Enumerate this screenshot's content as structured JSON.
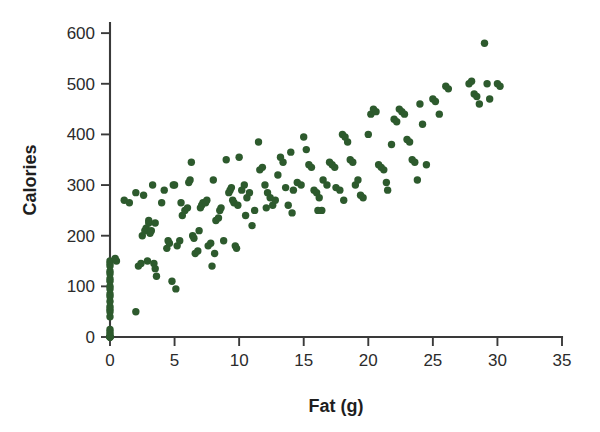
{
  "chart_data": {
    "type": "scatter",
    "title": "",
    "xlabel": "Fat (g)",
    "ylabel": "Calories",
    "xlim": [
      0,
      35
    ],
    "ylim": [
      0,
      620
    ],
    "xticks": [
      0,
      5,
      10,
      15,
      20,
      25,
      30,
      35
    ],
    "yticks": [
      0,
      100,
      200,
      300,
      400,
      500,
      600
    ],
    "xtick_labels": [
      "0",
      "5",
      "10",
      "15",
      "20",
      "25",
      "30",
      "35"
    ],
    "ytick_labels": [
      "0",
      "100",
      "200",
      "300",
      "400",
      "500",
      "600"
    ],
    "grid": false,
    "legend": false,
    "marker_color": "#2d5a2d",
    "marker_size": 5.4,
    "axis_color": "#3a3a3a",
    "background_color": "#ffffff",
    "n_points": 178,
    "series": [
      {
        "name": "Menu items",
        "color": "#2d5a2d",
        "points": [
          [
            0,
            0
          ],
          [
            0,
            0
          ],
          [
            0,
            0
          ],
          [
            0,
            0
          ],
          [
            0,
            5
          ],
          [
            0,
            10
          ],
          [
            0,
            15
          ],
          [
            0,
            40
          ],
          [
            0,
            50
          ],
          [
            0,
            55
          ],
          [
            0,
            60
          ],
          [
            0,
            70
          ],
          [
            0,
            80
          ],
          [
            0,
            85
          ],
          [
            0,
            95
          ],
          [
            0,
            100
          ],
          [
            0,
            110
          ],
          [
            0,
            115
          ],
          [
            0,
            125
          ],
          [
            0,
            130
          ],
          [
            0,
            140
          ],
          [
            0,
            145
          ],
          [
            0,
            150
          ],
          [
            0.4,
            155
          ],
          [
            0.5,
            150
          ],
          [
            2.0,
            50
          ],
          [
            1.1,
            270
          ],
          [
            1.5,
            265
          ],
          [
            2.0,
            285
          ],
          [
            2.2,
            140
          ],
          [
            2.4,
            145
          ],
          [
            2.5,
            200
          ],
          [
            2.6,
            280
          ],
          [
            2.7,
            210
          ],
          [
            2.8,
            215
          ],
          [
            2.9,
            150
          ],
          [
            3.0,
            225
          ],
          [
            3.0,
            230
          ],
          [
            3.1,
            205
          ],
          [
            3.2,
            210
          ],
          [
            3.3,
            300
          ],
          [
            3.4,
            145
          ],
          [
            3.5,
            135
          ],
          [
            3.6,
            120
          ],
          [
            3.5,
            225
          ],
          [
            4.0,
            265
          ],
          [
            4.2,
            290
          ],
          [
            4.4,
            175
          ],
          [
            4.6,
            185
          ],
          [
            4.5,
            190
          ],
          [
            4.8,
            110
          ],
          [
            5.0,
            300
          ],
          [
            5.1,
            95
          ],
          [
            5.2,
            180
          ],
          [
            5.4,
            190
          ],
          [
            5.6,
            240
          ],
          [
            5.8,
            250
          ],
          [
            6.0,
            255
          ],
          [
            6.1,
            305
          ],
          [
            6.2,
            310
          ],
          [
            6.3,
            345
          ],
          [
            6.4,
            200
          ],
          [
            6.5,
            195
          ],
          [
            6.6,
            165
          ],
          [
            6.8,
            170
          ],
          [
            7.0,
            255
          ],
          [
            7.1,
            260
          ],
          [
            7.2,
            265
          ],
          [
            7.4,
            265
          ],
          [
            7.5,
            270
          ],
          [
            7.6,
            180
          ],
          [
            7.8,
            185
          ],
          [
            7.9,
            140
          ],
          [
            8.0,
            310
          ],
          [
            8.2,
            230
          ],
          [
            8.4,
            235
          ],
          [
            8.5,
            250
          ],
          [
            8.6,
            255
          ],
          [
            8.8,
            190
          ],
          [
            9.0,
            350
          ],
          [
            9.2,
            285
          ],
          [
            9.3,
            290
          ],
          [
            9.4,
            295
          ],
          [
            9.5,
            270
          ],
          [
            9.6,
            265
          ],
          [
            9.7,
            180
          ],
          [
            9.8,
            175
          ],
          [
            9.9,
            260
          ],
          [
            10.0,
            355
          ],
          [
            10.2,
            290
          ],
          [
            10.4,
            300
          ],
          [
            10.6,
            275
          ],
          [
            10.8,
            285
          ],
          [
            11.0,
            220
          ],
          [
            11.2,
            250
          ],
          [
            11.5,
            385
          ],
          [
            11.6,
            330
          ],
          [
            11.8,
            335
          ],
          [
            12.0,
            300
          ],
          [
            12.2,
            285
          ],
          [
            12.4,
            275
          ],
          [
            12.6,
            260
          ],
          [
            12.8,
            270
          ],
          [
            13.0,
            320
          ],
          [
            13.2,
            355
          ],
          [
            13.4,
            345
          ],
          [
            13.6,
            295
          ],
          [
            13.8,
            260
          ],
          [
            14.0,
            365
          ],
          [
            14.2,
            290
          ],
          [
            14.5,
            305
          ],
          [
            14.8,
            300
          ],
          [
            15.0,
            395
          ],
          [
            15.2,
            370
          ],
          [
            15.4,
            340
          ],
          [
            15.6,
            335
          ],
          [
            15.8,
            290
          ],
          [
            16.0,
            285
          ],
          [
            16.2,
            275
          ],
          [
            16.4,
            250
          ],
          [
            16.5,
            310
          ],
          [
            16.8,
            300
          ],
          [
            17.0,
            345
          ],
          [
            17.2,
            340
          ],
          [
            17.4,
            335
          ],
          [
            17.5,
            295
          ],
          [
            17.8,
            290
          ],
          [
            18.0,
            400
          ],
          [
            18.2,
            395
          ],
          [
            18.4,
            385
          ],
          [
            18.6,
            350
          ],
          [
            18.8,
            345
          ],
          [
            19.0,
            300
          ],
          [
            19.2,
            310
          ],
          [
            19.4,
            280
          ],
          [
            19.6,
            275
          ],
          [
            20.0,
            400
          ],
          [
            20.2,
            440
          ],
          [
            20.4,
            450
          ],
          [
            20.6,
            445
          ],
          [
            20.8,
            340
          ],
          [
            21.0,
            335
          ],
          [
            21.2,
            330
          ],
          [
            21.4,
            305
          ],
          [
            21.5,
            290
          ],
          [
            22.0,
            430
          ],
          [
            22.2,
            425
          ],
          [
            22.4,
            450
          ],
          [
            22.6,
            445
          ],
          [
            22.8,
            440
          ],
          [
            23.0,
            390
          ],
          [
            23.2,
            385
          ],
          [
            23.4,
            350
          ],
          [
            23.6,
            345
          ],
          [
            23.8,
            310
          ],
          [
            24.0,
            460
          ],
          [
            24.2,
            420
          ],
          [
            24.5,
            340
          ],
          [
            25.0,
            470
          ],
          [
            25.2,
            465
          ],
          [
            25.5,
            440
          ],
          [
            26.0,
            495
          ],
          [
            26.2,
            490
          ],
          [
            27.8,
            500
          ],
          [
            28.0,
            505
          ],
          [
            28.2,
            480
          ],
          [
            28.4,
            475
          ],
          [
            28.6,
            460
          ],
          [
            29.0,
            580
          ],
          [
            29.2,
            500
          ],
          [
            29.4,
            470
          ],
          [
            30.0,
            500
          ],
          [
            30.2,
            495
          ],
          [
            4.9,
            300
          ],
          [
            5.5,
            265
          ],
          [
            6.9,
            210
          ],
          [
            8.1,
            165
          ],
          [
            10.5,
            240
          ],
          [
            12.1,
            255
          ],
          [
            14.1,
            245
          ],
          [
            16.1,
            250
          ],
          [
            18.1,
            270
          ],
          [
            21.8,
            380
          ]
        ]
      }
    ],
    "annotations": []
  },
  "geometry": {
    "plot_left": 110,
    "plot_right": 562,
    "plot_bottom": 337,
    "plot_top": 23
  }
}
